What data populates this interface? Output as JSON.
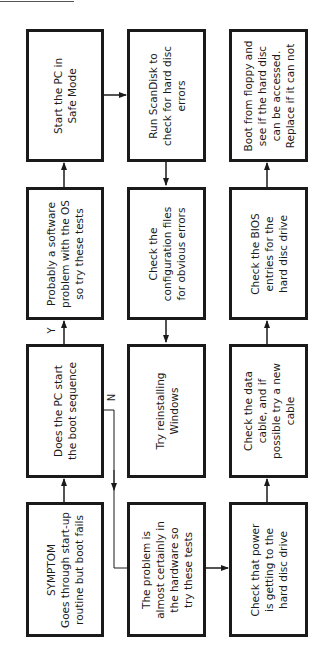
{
  "diagram": {
    "type": "flowchart",
    "orientation": "rotated-90-ccw",
    "nodes": [
      {
        "id": "symptom",
        "text": "SYMPTOM\nGoes through start-up\nroutine but boot fails"
      },
      {
        "id": "boot_seq",
        "text": "Does the PC start\nthe boot sequence"
      },
      {
        "id": "software",
        "text": "Probably a software\nproblem with the OS\nso try these tests"
      },
      {
        "id": "safe_mode",
        "text": "Start the PC in\nSafe Mode"
      },
      {
        "id": "scandisk",
        "text": "Run ScanDisk to\ncheck for hard disc\nerrors"
      },
      {
        "id": "config",
        "text": "Check the\nconfiguration files\nfor obvious errors"
      },
      {
        "id": "reinstall",
        "text": "Try reinstalling\nWindows"
      },
      {
        "id": "hardware",
        "text": "The problem is\nalmost certainly in\nthe hardware so\ntry these tests"
      },
      {
        "id": "power",
        "text": "Check that power\nis getting to the\nhard disc drive"
      },
      {
        "id": "cable",
        "text": "Check the data\ncable, and if\npossible try a new\ncable"
      },
      {
        "id": "bios",
        "text": "Check the BIOS\nentries for the\nhard disc drive"
      },
      {
        "id": "floppy",
        "text": "Boot from floppy and\nsee if the hard disc\ncan be accessed.\nReplace if it can not"
      }
    ],
    "edges": [
      {
        "from": "symptom",
        "to": "boot_seq",
        "label": ""
      },
      {
        "from": "boot_seq",
        "to": "software",
        "label": "Y"
      },
      {
        "from": "boot_seq",
        "to": "hardware",
        "label": "N"
      },
      {
        "from": "software",
        "to": "safe_mode",
        "label": ""
      },
      {
        "from": "safe_mode",
        "to": "scandisk",
        "label": ""
      },
      {
        "from": "scandisk",
        "to": "config",
        "label": ""
      },
      {
        "from": "config",
        "to": "reinstall",
        "label": ""
      },
      {
        "from": "hardware",
        "to": "power",
        "label": ""
      },
      {
        "from": "power",
        "to": "cable",
        "label": ""
      },
      {
        "from": "cable",
        "to": "bios",
        "label": ""
      },
      {
        "from": "bios",
        "to": "floppy",
        "label": ""
      }
    ],
    "labels": {
      "yes": "Y",
      "no": "N"
    }
  },
  "colors": {
    "ink": "#1a1a1a",
    "background": "#ffffff"
  }
}
